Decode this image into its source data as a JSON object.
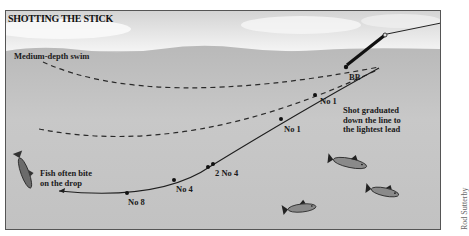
{
  "diagram": {
    "title": "SHOTTING THE STICK",
    "labels": {
      "swim": "Medium-depth swim",
      "bb": "BB",
      "no1_upper": "No 1",
      "no1_lower": "No 1",
      "shot_note_line1": "Shot graduated",
      "shot_note_line2": "down the line to",
      "shot_note_line3": "the lightest lead",
      "two_no4": "2 No 4",
      "no4": "No 4",
      "no8": "No 8",
      "fish_note_line1": "Fish often bite",
      "fish_note_line2": "on the drop"
    },
    "credit": "Rod Sutterby",
    "colors": {
      "sky": "#e8e8e8",
      "water": "#c4c4c4",
      "line": "#222222",
      "text": "#1a1a1a"
    }
  }
}
